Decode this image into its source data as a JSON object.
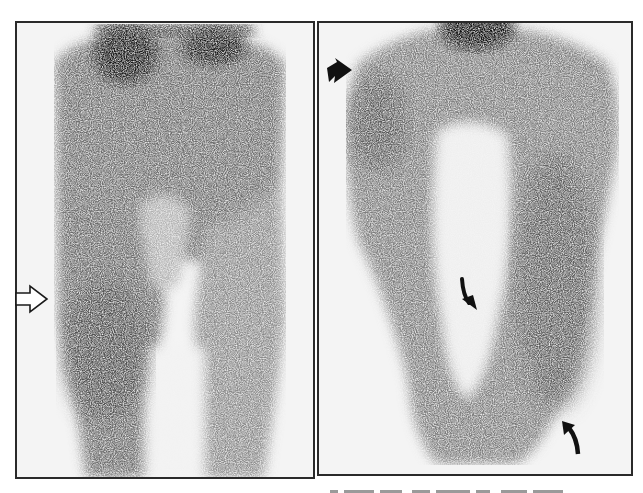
{
  "figure": {
    "type": "scintigraphy",
    "colors": {
      "background": "#ffffff",
      "panel_bg": "#f4f4f4",
      "frame": "#2a2a2a",
      "uptake": "#1a1a1a"
    }
  },
  "panels": [
    {
      "id": "left",
      "annotations": [
        {
          "type": "open-arrow",
          "direction": "right",
          "icon": "open-arrow-right-icon"
        }
      ]
    },
    {
      "id": "right",
      "annotations": [
        {
          "type": "solid-arrowhead",
          "direction": "right-down",
          "icon": "arrowhead-icon"
        },
        {
          "type": "curved-arrow",
          "direction": "down",
          "icon": "curved-arrow-down-icon"
        },
        {
          "type": "curved-arrow",
          "direction": "up",
          "icon": "curved-arrow-up-icon"
        }
      ]
    }
  ]
}
